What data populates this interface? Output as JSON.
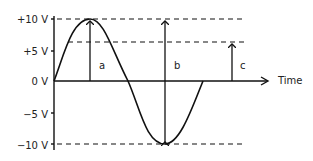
{
  "diagram": {
    "type": "sine-wave-amplitude",
    "y_labels": [
      "+10 V",
      "+5 V",
      "0 V",
      "−5 V",
      "−10 V"
    ],
    "x_label": "Time",
    "arrows": [
      {
        "label": "a",
        "meaning": "peak amplitude",
        "from_v": 0,
        "to_v": 10
      },
      {
        "label": "b",
        "meaning": "peak-to-peak",
        "from_v": -10,
        "to_v": 10
      },
      {
        "label": "c",
        "meaning": "partial level",
        "from_v": 0,
        "to_v": 7
      }
    ],
    "reference_lines": [
      "+10 V",
      "+7 V",
      "−10 V"
    ]
  }
}
